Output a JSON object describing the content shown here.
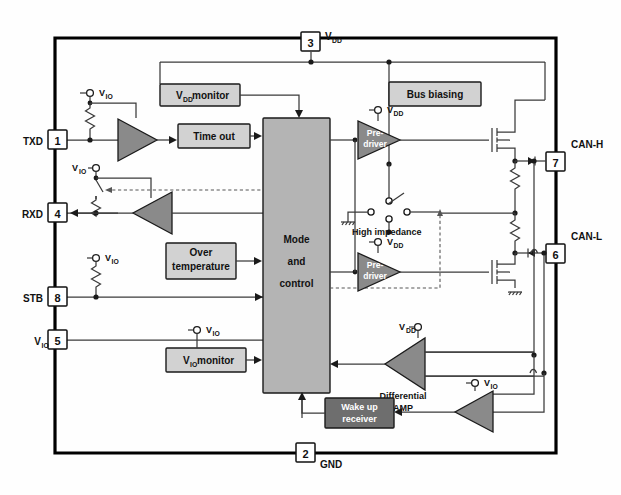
{
  "figure": {
    "type": "can-transceiver-block-diagram",
    "caption": ""
  },
  "pins": {
    "vdd": {
      "number": "3",
      "label": "V",
      "sub": "DD"
    },
    "gnd": {
      "number": "2",
      "label": "GND",
      "sub": ""
    },
    "txd": {
      "number": "1",
      "label": "TXD",
      "sub": ""
    },
    "rxd": {
      "number": "4",
      "label": "RXD",
      "sub": ""
    },
    "stb": {
      "number": "8",
      "label": "STB",
      "sub": ""
    },
    "vio": {
      "number": "5",
      "label": "V",
      "sub": "IO"
    },
    "canh": {
      "number": "7",
      "label": "CAN-H",
      "sub": ""
    },
    "canl": {
      "number": "6",
      "label": "CAN-L",
      "sub": ""
    }
  },
  "blocks": {
    "vdd_monitor": {
      "label": "V",
      "sub": "DD",
      "label2": " monitor"
    },
    "time_out": {
      "label": "Time out"
    },
    "over_temp": {
      "line1": "Over",
      "line2": "temperature"
    },
    "vio_monitor": {
      "label": "V",
      "sub": "IO",
      "label2": " monitor"
    },
    "mode_control": {
      "line1": "Mode",
      "line2": "and",
      "line3": "control"
    },
    "bus_biasing": {
      "label": "Bus biasing"
    },
    "wake_up": {
      "line1": "Wake up",
      "line2": "receiver"
    }
  },
  "amps": {
    "predriver_high": {
      "line1": "Pre-",
      "line2": "driver",
      "supply": "V",
      "supply_sub": "DD"
    },
    "predriver_low": {
      "line1": "Pre-",
      "line2": "driver",
      "supply": "V",
      "supply_sub": "DD"
    },
    "diff_amp": {
      "line1": "Differential",
      "line2": "AMP",
      "supply": "V",
      "supply_sub": "DD"
    },
    "wake_amp": {
      "supply": "V",
      "supply_sub": "IO"
    },
    "txd_buffer": {
      "supply": "V",
      "supply_sub": "IO"
    },
    "rxd_buffer": {
      "supply": "V",
      "supply_sub": "IO"
    }
  },
  "annotations": {
    "high_impedance": "High impedance",
    "vio_supply_txd": {
      "label": "V",
      "sub": "IO"
    },
    "vio_supply_rxd": {
      "label": "V",
      "sub": "IO"
    },
    "vio_supply_stb": {
      "label": "V",
      "sub": "IO"
    },
    "vio_supply_vio": {
      "label": "V",
      "sub": "IO"
    }
  },
  "colors": {
    "light_block": "#d2d2d2",
    "dark_block": "#6e6e6e",
    "triangle": "#8a8a8a",
    "mode_block": "#b4b4b4",
    "wire": "#3a3a3a",
    "bus": "#000000"
  }
}
